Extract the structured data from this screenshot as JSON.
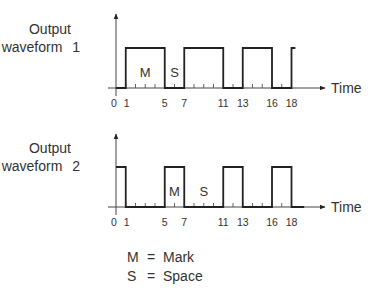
{
  "chart_data": [
    {
      "type": "line",
      "step": true,
      "title_lines": [
        "Output",
        "waveform  1"
      ],
      "xlabel": "Time",
      "ylabel": "",
      "xlim": [
        0,
        21
      ],
      "tick_labels": [
        "0",
        "1",
        "5",
        "7",
        "11",
        "13",
        "16",
        "18"
      ],
      "tick_values": [
        0,
        1,
        5,
        7,
        11,
        13,
        16,
        18
      ],
      "minor_ticks": [
        1,
        2,
        3,
        4,
        5,
        6,
        7,
        8,
        9,
        10,
        11,
        12,
        13,
        14,
        15,
        16,
        17,
        18
      ],
      "segments": [
        {
          "from": 0,
          "to": 1,
          "level": 0
        },
        {
          "from": 1,
          "to": 5,
          "level": 1
        },
        {
          "from": 5,
          "to": 7,
          "level": 0
        },
        {
          "from": 7,
          "to": 11,
          "level": 1
        },
        {
          "from": 11,
          "to": 13,
          "level": 0
        },
        {
          "from": 13,
          "to": 16,
          "level": 1
        },
        {
          "from": 16,
          "to": 18,
          "level": 0
        },
        {
          "from": 18,
          "to": 18.4,
          "level": 1
        }
      ],
      "annotations": [
        {
          "text": "M",
          "x": 3
        },
        {
          "text": "S",
          "x": 6
        }
      ]
    },
    {
      "type": "line",
      "step": true,
      "title_lines": [
        "Output",
        "waveform  2"
      ],
      "xlabel": "Time",
      "ylabel": "",
      "xlim": [
        0,
        21
      ],
      "tick_labels": [
        "0",
        "1",
        "5",
        "7",
        "11",
        "13",
        "16",
        "18"
      ],
      "tick_values": [
        0,
        1,
        5,
        7,
        11,
        13,
        16,
        18
      ],
      "minor_ticks": [
        1,
        2,
        3,
        4,
        5,
        6,
        7,
        8,
        9,
        10,
        11,
        12,
        13,
        14,
        15,
        16,
        17,
        18
      ],
      "segments": [
        {
          "from": 0,
          "to": 1,
          "level": 1
        },
        {
          "from": 1,
          "to": 5,
          "level": 0
        },
        {
          "from": 5,
          "to": 7,
          "level": 1
        },
        {
          "from": 7,
          "to": 11,
          "level": 0
        },
        {
          "from": 11,
          "to": 13,
          "level": 1
        },
        {
          "from": 13,
          "to": 16,
          "level": 0
        },
        {
          "from": 16,
          "to": 18,
          "level": 1
        },
        {
          "from": 18,
          "to": 19.3,
          "level": 0
        }
      ],
      "annotations": [
        {
          "text": "M",
          "x": 6
        },
        {
          "text": "S",
          "x": 9
        }
      ]
    }
  ],
  "legend": [
    {
      "symbol": "M",
      "eq": "=",
      "meaning": "Mark"
    },
    {
      "symbol": "S",
      "eq": "=",
      "meaning": "Space"
    }
  ]
}
